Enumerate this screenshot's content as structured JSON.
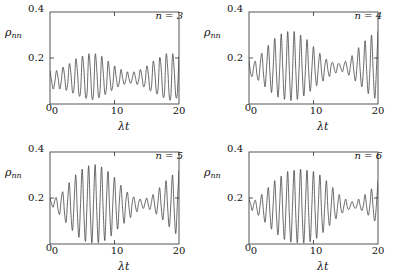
{
  "figure": {
    "panel_label_prefix": "n",
    "background_color": "#ffffff",
    "line_color": "#3a3a3a"
  },
  "chart_data": [
    {
      "type": "line",
      "title": "",
      "panel_label": "n = 3",
      "xlabel": "λt",
      "ylabel": "ρnn",
      "ylabel_base": "ρ",
      "ylabel_sub": "nn",
      "xlim": [
        0,
        20
      ],
      "ylim": [
        0,
        0.4
      ],
      "xticks": [
        0,
        10,
        20
      ],
      "xtick_labels": [
        "0",
        "10",
        "20"
      ],
      "yticks": [
        0,
        0.2,
        0.4
      ],
      "ytick_labels": [
        "0",
        "0.2",
        "0.4"
      ],
      "grid": false,
      "legend": "none",
      "mean_level": 0.11,
      "series": [
        {
          "name": "rho_33",
          "n": 3,
          "description": "Collapse and revival oscillation of the diagonal density matrix element",
          "x": [
            0,
            0.25,
            0.5,
            0.75,
            1,
            1.25,
            1.5,
            1.75,
            2,
            2.25,
            2.5,
            2.75,
            3,
            3.25,
            3.5,
            3.75,
            4,
            4.25,
            4.5,
            4.75,
            5,
            5.25,
            5.5,
            5.75,
            6,
            6.25,
            6.5,
            6.75,
            7,
            7.25,
            7.5,
            7.75,
            8,
            8.25,
            8.5,
            8.75,
            9,
            9.25,
            9.5,
            9.75,
            10,
            10.25,
            10.5,
            10.75,
            11,
            11.25,
            11.5,
            11.75,
            12,
            12.25,
            12.5,
            12.75,
            13,
            13.25,
            13.5,
            13.75,
            14,
            14.25,
            14.5,
            14.75,
            15,
            15.25,
            15.5,
            15.75,
            16,
            16.25,
            16.5,
            16.75,
            17,
            17.25,
            17.5,
            17.75,
            18,
            18.25,
            18.5,
            18.75,
            19,
            19.25,
            19.5,
            19.75,
            20
          ],
          "y": [
            0.145,
            0.1,
            0.065,
            0.095,
            0.145,
            0.115,
            0.065,
            0.1,
            0.16,
            0.125,
            0.06,
            0.09,
            0.175,
            0.13,
            0.05,
            0.075,
            0.195,
            0.14,
            0.04,
            0.06,
            0.205,
            0.15,
            0.035,
            0.05,
            0.215,
            0.155,
            0.03,
            0.045,
            0.215,
            0.15,
            0.035,
            0.055,
            0.205,
            0.14,
            0.045,
            0.07,
            0.185,
            0.13,
            0.06,
            0.085,
            0.165,
            0.12,
            0.075,
            0.095,
            0.15,
            0.115,
            0.085,
            0.105,
            0.14,
            0.11,
            0.09,
            0.11,
            0.14,
            0.115,
            0.085,
            0.105,
            0.15,
            0.12,
            0.075,
            0.095,
            0.165,
            0.13,
            0.06,
            0.08,
            0.185,
            0.14,
            0.05,
            0.065,
            0.2,
            0.15,
            0.04,
            0.05,
            0.215,
            0.155,
            0.03,
            0.04,
            0.215,
            0.15,
            0.035,
            0.05,
            0.205
          ]
        }
      ]
    },
    {
      "type": "line",
      "title": "",
      "panel_label": "n = 4",
      "xlabel": "λt",
      "ylabel": "ρnn",
      "ylabel_base": "ρ",
      "ylabel_sub": "nn",
      "xlim": [
        0,
        20
      ],
      "ylim": [
        0,
        0.4
      ],
      "xticks": [
        0,
        10,
        20
      ],
      "xtick_labels": [
        "0",
        "10",
        "20"
      ],
      "yticks": [
        0,
        0.2,
        0.4
      ],
      "ytick_labels": [
        "0",
        "0.2",
        "0.4"
      ],
      "grid": false,
      "legend": "none",
      "mean_level": 0.155,
      "series": [
        {
          "name": "rho_44",
          "n": 4,
          "description": "Collapse and revival oscillation of the diagonal density matrix element",
          "x": [
            0,
            0.25,
            0.5,
            0.75,
            1,
            1.25,
            1.5,
            1.75,
            2,
            2.25,
            2.5,
            2.75,
            3,
            3.25,
            3.5,
            3.75,
            4,
            4.25,
            4.5,
            4.75,
            5,
            5.25,
            5.5,
            5.75,
            6,
            6.25,
            6.5,
            6.75,
            7,
            7.25,
            7.5,
            7.75,
            8,
            8.25,
            8.5,
            8.75,
            9,
            9.25,
            9.5,
            9.75,
            10,
            10.25,
            10.5,
            10.75,
            11,
            11.25,
            11.5,
            11.75,
            12,
            12.25,
            12.5,
            12.75,
            13,
            13.25,
            13.5,
            13.75,
            14,
            14.25,
            14.5,
            14.75,
            15,
            15.25,
            15.5,
            15.75,
            16,
            16.25,
            16.5,
            16.75,
            17,
            17.25,
            17.5,
            17.75,
            18,
            18.25,
            18.5,
            18.75,
            19,
            19.25,
            19.5,
            19.75,
            20
          ],
          "y": [
            0.19,
            0.135,
            0.12,
            0.165,
            0.185,
            0.125,
            0.105,
            0.175,
            0.22,
            0.13,
            0.075,
            0.17,
            0.255,
            0.135,
            0.05,
            0.16,
            0.285,
            0.14,
            0.03,
            0.15,
            0.305,
            0.145,
            0.02,
            0.145,
            0.315,
            0.15,
            0.015,
            0.14,
            0.315,
            0.15,
            0.02,
            0.145,
            0.3,
            0.145,
            0.035,
            0.15,
            0.28,
            0.145,
            0.055,
            0.155,
            0.25,
            0.14,
            0.08,
            0.16,
            0.22,
            0.14,
            0.1,
            0.165,
            0.195,
            0.145,
            0.12,
            0.17,
            0.18,
            0.15,
            0.135,
            0.17,
            0.175,
            0.155,
            0.14,
            0.17,
            0.185,
            0.15,
            0.125,
            0.17,
            0.21,
            0.145,
            0.1,
            0.165,
            0.245,
            0.14,
            0.075,
            0.155,
            0.275,
            0.14,
            0.045,
            0.15,
            0.3,
            0.145,
            0.025,
            0.145,
            0.315
          ]
        }
      ]
    },
    {
      "type": "line",
      "title": "",
      "panel_label": "n = 5",
      "xlabel": "λt",
      "ylabel": "ρnn",
      "ylabel_base": "ρ",
      "ylabel_sub": "nn",
      "xlim": [
        0,
        20
      ],
      "ylim": [
        0,
        0.4
      ],
      "xticks": [
        0,
        10,
        20
      ],
      "xtick_labels": [
        "0",
        "10",
        "20"
      ],
      "yticks": [
        0,
        0.2,
        0.4
      ],
      "ytick_labels": [
        "0",
        "0.2",
        "0.4"
      ],
      "grid": false,
      "legend": "none",
      "mean_level": 0.175,
      "series": [
        {
          "name": "rho_55",
          "n": 5,
          "description": "Collapse and revival oscillation of the diagonal density matrix element",
          "x": [
            0,
            0.25,
            0.5,
            0.75,
            1,
            1.25,
            1.5,
            1.75,
            2,
            2.25,
            2.5,
            2.75,
            3,
            3.25,
            3.5,
            3.75,
            4,
            4.25,
            4.5,
            4.75,
            5,
            5.25,
            5.5,
            5.75,
            6,
            6.25,
            6.5,
            6.75,
            7,
            7.25,
            7.5,
            7.75,
            8,
            8.25,
            8.5,
            8.75,
            9,
            9.25,
            9.5,
            9.75,
            10,
            10.25,
            10.5,
            10.75,
            11,
            11.25,
            11.5,
            11.75,
            12,
            12.25,
            12.5,
            12.75,
            13,
            13.25,
            13.5,
            13.75,
            14,
            14.25,
            14.5,
            14.75,
            15,
            15.25,
            15.5,
            15.75,
            16,
            16.25,
            16.5,
            16.75,
            17,
            17.25,
            17.5,
            17.75,
            18,
            18.25,
            18.5,
            18.75,
            19,
            19.25,
            19.5,
            19.75,
            20
          ],
          "y": [
            0.2,
            0.175,
            0.16,
            0.19,
            0.2,
            0.15,
            0.13,
            0.195,
            0.225,
            0.135,
            0.095,
            0.195,
            0.265,
            0.13,
            0.06,
            0.19,
            0.3,
            0.13,
            0.03,
            0.185,
            0.325,
            0.135,
            0.012,
            0.18,
            0.34,
            0.14,
            0.005,
            0.18,
            0.345,
            0.145,
            0.005,
            0.18,
            0.335,
            0.145,
            0.015,
            0.185,
            0.315,
            0.15,
            0.035,
            0.185,
            0.29,
            0.15,
            0.065,
            0.185,
            0.255,
            0.155,
            0.09,
            0.185,
            0.225,
            0.16,
            0.115,
            0.18,
            0.205,
            0.165,
            0.14,
            0.18,
            0.195,
            0.17,
            0.155,
            0.18,
            0.2,
            0.17,
            0.15,
            0.185,
            0.215,
            0.165,
            0.13,
            0.185,
            0.245,
            0.16,
            0.105,
            0.185,
            0.275,
            0.155,
            0.075,
            0.185,
            0.3,
            0.15,
            0.045,
            0.18,
            0.32
          ]
        }
      ]
    },
    {
      "type": "line",
      "title": "",
      "panel_label": "n = 6",
      "xlabel": "λt",
      "ylabel": "ρnn",
      "ylabel_base": "ρ",
      "ylabel_sub": "nn",
      "xlim": [
        0,
        20
      ],
      "ylim": [
        0,
        0.4
      ],
      "xticks": [
        0,
        10,
        20
      ],
      "xtick_labels": [
        "0",
        "10",
        "20"
      ],
      "yticks": [
        0,
        0.2,
        0.4
      ],
      "ytick_labels": [
        "0",
        "0.2",
        "0.4"
      ],
      "grid": false,
      "legend": "none",
      "mean_level": 0.165,
      "series": [
        {
          "name": "rho_66",
          "n": 6,
          "description": "Collapse and revival oscillation of the diagonal density matrix element",
          "x": [
            0,
            0.25,
            0.5,
            0.75,
            1,
            1.25,
            1.5,
            1.75,
            2,
            2.25,
            2.5,
            2.75,
            3,
            3.25,
            3.5,
            3.75,
            4,
            4.25,
            4.5,
            4.75,
            5,
            5.25,
            5.5,
            5.75,
            6,
            6.25,
            6.5,
            6.75,
            7,
            7.25,
            7.5,
            7.75,
            8,
            8.25,
            8.5,
            8.75,
            9,
            9.25,
            9.5,
            9.75,
            10,
            10.25,
            10.5,
            10.75,
            11,
            11.25,
            11.5,
            11.75,
            12,
            12.25,
            12.5,
            12.75,
            13,
            13.25,
            13.5,
            13.75,
            14,
            14.25,
            14.5,
            14.75,
            15,
            15.25,
            15.5,
            15.75,
            16,
            16.25,
            16.5,
            16.75,
            17,
            17.25,
            17.5,
            17.75,
            18,
            18.25,
            18.5,
            18.75,
            19,
            19.25,
            19.5,
            19.75,
            20
          ],
          "y": [
            0.195,
            0.175,
            0.145,
            0.175,
            0.19,
            0.15,
            0.125,
            0.175,
            0.215,
            0.14,
            0.095,
            0.175,
            0.245,
            0.135,
            0.065,
            0.175,
            0.275,
            0.13,
            0.04,
            0.17,
            0.295,
            0.13,
            0.02,
            0.17,
            0.315,
            0.13,
            0.008,
            0.17,
            0.32,
            0.13,
            0.005,
            0.17,
            0.325,
            0.13,
            0.005,
            0.17,
            0.32,
            0.135,
            0.01,
            0.17,
            0.315,
            0.14,
            0.025,
            0.17,
            0.3,
            0.14,
            0.05,
            0.17,
            0.275,
            0.145,
            0.08,
            0.17,
            0.245,
            0.15,
            0.11,
            0.17,
            0.215,
            0.155,
            0.135,
            0.17,
            0.195,
            0.16,
            0.15,
            0.17,
            0.185,
            0.165,
            0.155,
            0.17,
            0.195,
            0.165,
            0.145,
            0.17,
            0.215,
            0.16,
            0.125,
            0.17,
            0.24,
            0.155,
            0.1,
            0.17,
            0.275
          ]
        }
      ]
    }
  ]
}
